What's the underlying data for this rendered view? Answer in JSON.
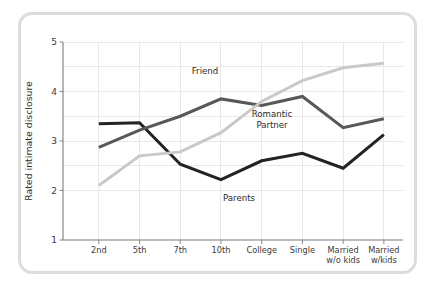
{
  "chart_data": {
    "type": "line",
    "title": "",
    "xlabel": "",
    "ylabel": "Rated intimate disclosure",
    "ylim": [
      1,
      5
    ],
    "yticks": [
      1,
      2,
      3,
      4,
      5
    ],
    "ytick_labels": [
      "1",
      "2",
      "3",
      "4",
      "5"
    ],
    "gridlines_y": [
      2,
      2.5,
      3,
      3.5,
      4,
      4.5,
      5
    ],
    "grid": true,
    "legend_position": "inline-annotations",
    "categories": [
      "2nd",
      "5th",
      "7th",
      "10th",
      "College",
      "Single",
      "Married w/o kids",
      "Married w/kids"
    ],
    "category_lines": [
      [
        "2nd"
      ],
      [
        "5th"
      ],
      [
        "7th"
      ],
      [
        "10th"
      ],
      [
        "College"
      ],
      [
        "Single"
      ],
      [
        "Married",
        "w/o kids"
      ],
      [
        "Married",
        "w/kids"
      ]
    ],
    "series": [
      {
        "name": "Parents",
        "color": "#232323",
        "width": 3.0,
        "values": [
          3.35,
          3.37,
          2.53,
          2.22,
          2.6,
          2.75,
          2.45,
          3.13
        ]
      },
      {
        "name": "Friend",
        "color": "#585858",
        "width": 3.0,
        "values": [
          2.87,
          3.22,
          3.5,
          3.85,
          3.72,
          3.9,
          3.27,
          3.45
        ]
      },
      {
        "name": "Romantic Partner",
        "color": "#c9c9c9",
        "width": 3.0,
        "values": [
          2.1,
          2.7,
          2.78,
          3.17,
          3.8,
          4.22,
          4.48,
          4.57
        ]
      }
    ],
    "annotations": [
      {
        "id": "friend",
        "text": [
          "Friend"
        ],
        "x": 205,
        "y": 74
      },
      {
        "id": "romantic",
        "text": [
          "Romantic",
          "Partner"
        ],
        "x": 272,
        "y": 117
      },
      {
        "id": "parents",
        "text": [
          "Parents"
        ],
        "x": 239,
        "y": 201
      }
    ]
  },
  "frame": {
    "border_color": "#dcdcdc",
    "background": "#ffffff"
  }
}
